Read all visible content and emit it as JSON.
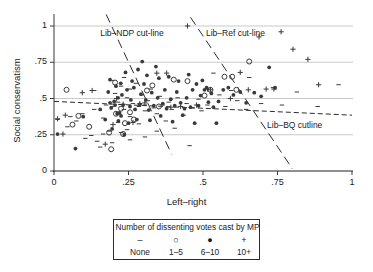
{
  "chart_data": {
    "type": "scatter",
    "title": "",
    "xlabel": "Left–right",
    "ylabel": "Social conservatism",
    "xlim": [
      0,
      1
    ],
    "ylim": [
      0,
      1
    ],
    "xticks": [
      "0",
      ".25",
      ".5",
      ".75",
      "1"
    ],
    "xtick_values": [
      0,
      0.25,
      0.5,
      0.75,
      1
    ],
    "yticks": [
      "0",
      ".25",
      ".5",
      ".75",
      "1"
    ],
    "ytick_values": [
      0,
      0.25,
      0.5,
      0.75,
      1
    ],
    "grid": "horizontal",
    "legend_position": "below-plot",
    "series": [
      {
        "name": "None",
        "marker": "dash",
        "points": [
          [
            0.012,
            0.355
          ],
          [
            0.045,
            0.305
          ],
          [
            0.075,
            0.345
          ],
          [
            0.095,
            0.395
          ],
          [
            0.105,
            0.225
          ],
          [
            0.125,
            0.245
          ],
          [
            0.135,
            0.555
          ],
          [
            0.145,
            0.205
          ],
          [
            0.155,
            0.165
          ],
          [
            0.165,
            0.365
          ],
          [
            0.175,
            0.455
          ],
          [
            0.185,
            0.275
          ],
          [
            0.195,
            0.625
          ],
          [
            0.205,
            0.535
          ],
          [
            0.215,
            0.475
          ],
          [
            0.215,
            0.335
          ],
          [
            0.225,
            0.585
          ],
          [
            0.235,
            0.645
          ],
          [
            0.235,
            0.425
          ],
          [
            0.245,
            0.505
          ],
          [
            0.245,
            0.285
          ],
          [
            0.255,
            0.565
          ],
          [
            0.255,
            0.375
          ],
          [
            0.265,
            0.465
          ],
          [
            0.275,
            0.605
          ],
          [
            0.285,
            0.445
          ],
          [
            0.285,
            0.325
          ],
          [
            0.295,
            0.525
          ],
          [
            0.305,
            0.415
          ],
          [
            0.315,
            0.485
          ],
          [
            0.325,
            0.565
          ],
          [
            0.335,
            0.435
          ],
          [
            0.345,
            0.395
          ],
          [
            0.355,
            0.515
          ],
          [
            0.365,
            0.455
          ],
          [
            0.375,
            0.345
          ],
          [
            0.385,
            0.475
          ],
          [
            0.395,
            0.425
          ],
          [
            0.405,
            0.295
          ],
          [
            0.415,
            0.505
          ],
          [
            0.425,
            0.445
          ],
          [
            0.435,
            0.385
          ],
          [
            0.445,
            0.465
          ],
          [
            0.455,
            0.175
          ],
          [
            0.465,
            0.435
          ],
          [
            0.485,
            0.495
          ],
          [
            0.495,
            0.415
          ],
          [
            0.515,
            0.455
          ],
          [
            0.535,
            0.675
          ],
          [
            0.555,
            0.525
          ],
          [
            0.575,
            0.445
          ],
          [
            0.595,
            0.555
          ],
          [
            0.615,
            0.485
          ],
          [
            0.645,
            0.425
          ],
          [
            0.655,
            0.645
          ],
          [
            0.695,
            0.465
          ],
          [
            0.735,
            0.575
          ],
          [
            0.765,
            0.455
          ],
          [
            0.815,
            0.545
          ],
          [
            0.885,
            0.445
          ],
          [
            0.955,
            0.595
          ],
          [
            0.135,
            0.425
          ],
          [
            0.165,
            0.255
          ],
          [
            0.195,
            0.195
          ],
          [
            0.225,
            0.265
          ],
          [
            0.255,
            0.215
          ],
          [
            0.305,
            0.235
          ],
          [
            0.345,
            0.275
          ],
          [
            0.195,
            0.445
          ],
          [
            0.215,
            0.405
          ],
          [
            0.055,
            0.375
          ],
          [
            0.305,
            0.455
          ]
        ]
      },
      {
        "name": "1–5",
        "marker": "circle",
        "points": [
          [
            0.042,
            0.56
          ],
          [
            0.062,
            0.32
          ],
          [
            0.082,
            0.38
          ],
          [
            0.118,
            0.305
          ],
          [
            0.185,
            0.265
          ],
          [
            0.192,
            0.15
          ],
          [
            0.208,
            0.395
          ],
          [
            0.225,
            0.43
          ],
          [
            0.232,
            0.255
          ],
          [
            0.255,
            0.405
          ],
          [
            0.268,
            0.355
          ],
          [
            0.312,
            0.555
          ],
          [
            0.33,
            0.59
          ],
          [
            0.352,
            0.445
          ],
          [
            0.402,
            0.63
          ],
          [
            0.448,
            0.62
          ],
          [
            0.505,
            0.52
          ],
          [
            0.525,
            0.56
          ],
          [
            0.572,
            0.65
          ],
          [
            0.598,
            0.65
          ],
          [
            0.612,
            0.56
          ],
          [
            0.655,
            0.755
          ],
          [
            0.238,
            0.33
          ],
          [
            0.205,
            0.61
          ]
        ]
      },
      {
        "name": "6–10",
        "marker": "dot",
        "points": [
          [
            0.012,
            0.255
          ],
          [
            0.072,
            0.155
          ],
          [
            0.098,
            0.375
          ],
          [
            0.155,
            0.425
          ],
          [
            0.172,
            0.355
          ],
          [
            0.182,
            0.545
          ],
          [
            0.188,
            0.63
          ],
          [
            0.195,
            0.29
          ],
          [
            0.202,
            0.48
          ],
          [
            0.208,
            0.585
          ],
          [
            0.212,
            0.395
          ],
          [
            0.216,
            0.345
          ],
          [
            0.22,
            0.4
          ],
          [
            0.224,
            0.605
          ],
          [
            0.228,
            0.525
          ],
          [
            0.232,
            0.455
          ],
          [
            0.236,
            0.25
          ],
          [
            0.24,
            0.68
          ],
          [
            0.245,
            0.56
          ],
          [
            0.25,
            0.33
          ],
          [
            0.255,
            0.445
          ],
          [
            0.258,
            0.49
          ],
          [
            0.262,
            0.62
          ],
          [
            0.268,
            0.575
          ],
          [
            0.272,
            0.425
          ],
          [
            0.278,
            0.355
          ],
          [
            0.282,
            0.7
          ],
          [
            0.288,
            0.46
          ],
          [
            0.292,
            0.53
          ],
          [
            0.296,
            0.755
          ],
          [
            0.302,
            0.6
          ],
          [
            0.308,
            0.49
          ],
          [
            0.312,
            0.66
          ],
          [
            0.318,
            0.42
          ],
          [
            0.322,
            0.35
          ],
          [
            0.328,
            0.54
          ],
          [
            0.335,
            0.45
          ],
          [
            0.342,
            0.72
          ],
          [
            0.348,
            0.505
          ],
          [
            0.352,
            0.64
          ],
          [
            0.358,
            0.38
          ],
          [
            0.365,
            0.465
          ],
          [
            0.372,
            0.56
          ],
          [
            0.378,
            0.43
          ],
          [
            0.385,
            0.65
          ],
          [
            0.392,
            0.495
          ],
          [
            0.398,
            0.34
          ],
          [
            0.405,
            0.45
          ],
          [
            0.412,
            0.545
          ],
          [
            0.418,
            0.62
          ],
          [
            0.425,
            0.47
          ],
          [
            0.432,
            0.385
          ],
          [
            0.438,
            0.43
          ],
          [
            0.445,
            0.505
          ],
          [
            0.452,
            0.665
          ],
          [
            0.458,
            0.44
          ],
          [
            0.465,
            0.56
          ],
          [
            0.472,
            0.33
          ],
          [
            0.478,
            0.6
          ],
          [
            0.485,
            0.45
          ],
          [
            0.492,
            0.52
          ],
          [
            0.498,
            0.625
          ],
          [
            0.505,
            0.56
          ],
          [
            0.512,
            0.575
          ],
          [
            0.518,
            0.475
          ],
          [
            0.528,
            0.535
          ],
          [
            0.535,
            0.44
          ],
          [
            0.545,
            0.33
          ],
          [
            0.552,
            0.48
          ],
          [
            0.568,
            0.56
          ],
          [
            0.585,
            0.575
          ],
          [
            0.602,
            0.525
          ],
          [
            0.625,
            0.545
          ],
          [
            0.645,
            0.47
          ],
          [
            0.672,
            0.54
          ],
          [
            0.695,
            0.515
          ],
          [
            0.722,
            0.715
          ],
          [
            0.742,
            0.575
          ],
          [
            0.205,
            0.455
          ],
          [
            0.215,
            0.505
          ],
          [
            0.188,
            0.47
          ],
          [
            0.192,
            0.435
          ],
          [
            0.225,
            0.38
          ]
        ]
      },
      {
        "name": "10+",
        "marker": "plus",
        "points": [
          [
            0.012,
            0.36
          ],
          [
            0.03,
            0.255
          ],
          [
            0.038,
            0.385
          ],
          [
            0.095,
            0.54
          ],
          [
            0.128,
            0.555
          ],
          [
            0.172,
            0.185
          ],
          [
            0.198,
            0.32
          ],
          [
            0.232,
            0.46
          ],
          [
            0.288,
            0.465
          ],
          [
            0.305,
            0.47
          ],
          [
            0.345,
            0.675
          ],
          [
            0.378,
            0.675
          ],
          [
            0.392,
            0.44
          ],
          [
            0.425,
            0.445
          ],
          [
            0.448,
            1.0
          ],
          [
            0.478,
            0.455
          ],
          [
            0.515,
            0.565
          ],
          [
            0.525,
            0.56
          ],
          [
            0.592,
            0.5
          ],
          [
            0.625,
            0.68
          ],
          [
            0.652,
            0.56
          ],
          [
            0.688,
            0.925
          ],
          [
            0.712,
            0.565
          ],
          [
            0.738,
            0.565
          ],
          [
            0.762,
            0.96
          ],
          [
            0.802,
            0.84
          ],
          [
            0.852,
            0.77
          ],
          [
            0.888,
            0.595
          ],
          [
            0.265,
            0.335
          ],
          [
            0.21,
            0.5
          ]
        ]
      }
    ],
    "reference_lines": [
      {
        "name": "Lib–NDP cut-line",
        "style": "long-dash",
        "x1": 0.175,
        "y1": 1.08,
        "x2": 0.395,
        "y2": 0.115,
        "label_x": 0.155,
        "label_y": 0.955
      },
      {
        "name": "Lib–Ref cut-line",
        "style": "long-dash",
        "x1": 0.458,
        "y1": 1.06,
        "x2": 0.8,
        "y2": 0.015,
        "label_x": 0.51,
        "label_y": 0.955
      },
      {
        "name": "Lib–BQ cutline",
        "style": "short-dash",
        "x1": 0.0,
        "y1": 0.48,
        "x2": 1.0,
        "y2": 0.385,
        "label_x": 0.715,
        "label_y": 0.32
      }
    ]
  },
  "legend": {
    "title": "Number of dissenting votes cast by MP",
    "entries": [
      {
        "symbol": "–",
        "label": "None"
      },
      {
        "symbol": "○",
        "label": "1–5"
      },
      {
        "symbol": "●",
        "label": "6–10"
      },
      {
        "symbol": "+",
        "label": "10+"
      }
    ]
  },
  "colors": {
    "marker": "#3a3a3a",
    "gridline": "#c9c9c9",
    "axis": "#3a3a3a",
    "background": "#ffffff",
    "text": "#1a1a1a"
  }
}
